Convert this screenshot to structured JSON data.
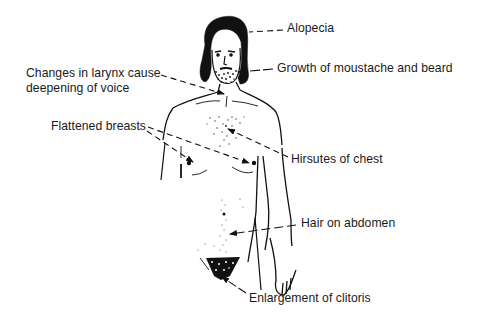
{
  "diagram": {
    "colors": {
      "ink": "#111111",
      "text": "#1a1a1a",
      "background": "#ffffff"
    },
    "labels": [
      {
        "id": "alopecia",
        "text": "Alopecia",
        "x": 287,
        "y": 21
      },
      {
        "id": "beard",
        "text": "Growth of moustache and beard",
        "x": 277,
        "y": 61
      },
      {
        "id": "larynx_1",
        "text": "Changes in larynx cause",
        "x": 26,
        "y": 66
      },
      {
        "id": "larynx_2",
        "text": "deepening of voice",
        "x": 26,
        "y": 81
      },
      {
        "id": "breasts",
        "text": "Flattened breasts",
        "x": 51,
        "y": 119
      },
      {
        "id": "chest",
        "text": "Hirsutes of chest",
        "x": 291,
        "y": 152
      },
      {
        "id": "abdomen",
        "text": "Hair on abdomen",
        "x": 301,
        "y": 216
      },
      {
        "id": "clitoris",
        "text": "Enlargement of clitoris",
        "x": 249,
        "y": 291
      }
    ]
  }
}
